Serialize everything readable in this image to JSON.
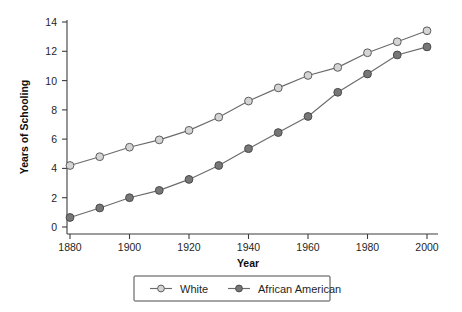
{
  "chart_data": {
    "type": "line",
    "title": "",
    "xlabel": "Year",
    "ylabel": "Years of Schooling",
    "xlim": [
      1880,
      2000
    ],
    "ylim": [
      0,
      14
    ],
    "grid": false,
    "legend_position": "bottom-center",
    "x": [
      1880,
      1890,
      1900,
      1910,
      1920,
      1930,
      1940,
      1950,
      1960,
      1970,
      1980,
      1990,
      2000
    ],
    "xticks": [
      1880,
      1900,
      1920,
      1940,
      1960,
      1980,
      2000
    ],
    "xtick_labels": [
      "1880",
      "1900",
      "1920",
      "1940",
      "1960",
      "1980",
      "2000"
    ],
    "yticks": [
      0,
      2,
      4,
      6,
      8,
      10,
      12,
      14
    ],
    "ytick_labels": [
      "0",
      "2",
      "4",
      "6",
      "8",
      "10",
      "12",
      "14"
    ],
    "series": [
      {
        "name": "White",
        "marker": "open-circle",
        "color": "#d4d4d4",
        "line_color": "#6b6b6b",
        "values": [
          4.2,
          4.8,
          5.45,
          5.95,
          6.6,
          7.5,
          8.6,
          9.5,
          10.35,
          10.9,
          11.9,
          12.65,
          13.4
        ]
      },
      {
        "name": "African American",
        "marker": "filled-circle",
        "color": "#777777",
        "line_color": "#6b6b6b",
        "values": [
          0.65,
          1.3,
          2.0,
          2.5,
          3.25,
          4.2,
          5.35,
          6.45,
          7.55,
          9.2,
          10.45,
          11.75,
          12.3
        ]
      }
    ]
  },
  "legend": {
    "entries": [
      {
        "label": "White"
      },
      {
        "label": "African American"
      }
    ]
  },
  "axes": {
    "x_title": "Year",
    "y_title": "Years of Schooling"
  }
}
